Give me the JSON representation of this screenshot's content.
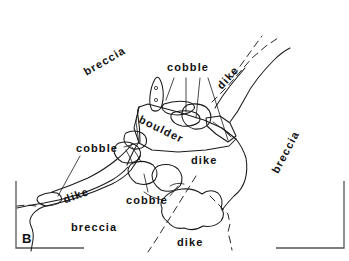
{
  "figure": {
    "panel_letter": "B",
    "labels": [
      {
        "id": "breccia-upper-left",
        "text": "breccia"
      },
      {
        "id": "cobble-top",
        "text": "cobble"
      },
      {
        "id": "dike-top-right",
        "text": "dike"
      },
      {
        "id": "boulder",
        "text": "boulder"
      },
      {
        "id": "breccia-right",
        "text": "breccia"
      },
      {
        "id": "cobble-left",
        "text": "cobble"
      },
      {
        "id": "dike-middle-right",
        "text": "dike"
      },
      {
        "id": "dike-left",
        "text": "dike"
      },
      {
        "id": "cobble-center",
        "text": "cobble"
      },
      {
        "id": "breccia-bottom-left",
        "text": "breccia"
      },
      {
        "id": "dike-bottom",
        "text": "dike"
      }
    ],
    "colors": {
      "ink": "#1a1a1a",
      "frame": "#555555",
      "background": "#ffffff"
    }
  }
}
